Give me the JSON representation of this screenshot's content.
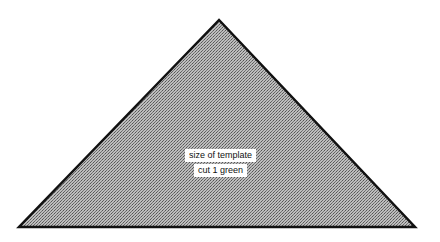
{
  "diagram": {
    "shape": "triangle",
    "fill_pattern": "grey-hatch",
    "stroke_color": "#111111",
    "fill_color": "#a8a8a8",
    "vertices": {
      "apex": [
        219,
        20
      ],
      "bottom_left": [
        19,
        227
      ],
      "bottom_right": [
        415,
        227
      ]
    },
    "labels": {
      "line1": "size of template",
      "line2": "cut 1 green"
    }
  }
}
